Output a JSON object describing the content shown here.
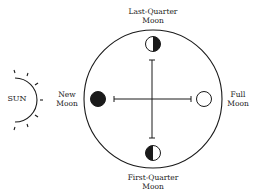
{
  "diagram": {
    "sun": {
      "label": "SUN"
    },
    "phases": {
      "last_quarter": {
        "line1": "Last-Quarter",
        "line2": "Moon"
      },
      "new": {
        "line1": "New",
        "line2": "Moon"
      },
      "full": {
        "line1": "Full",
        "line2": "Moon"
      },
      "first_quarter": {
        "line1": "First-Quarter",
        "line2": "Moon"
      }
    },
    "colors": {
      "ink": "#1a1a1a",
      "background": "#ffffff"
    }
  }
}
